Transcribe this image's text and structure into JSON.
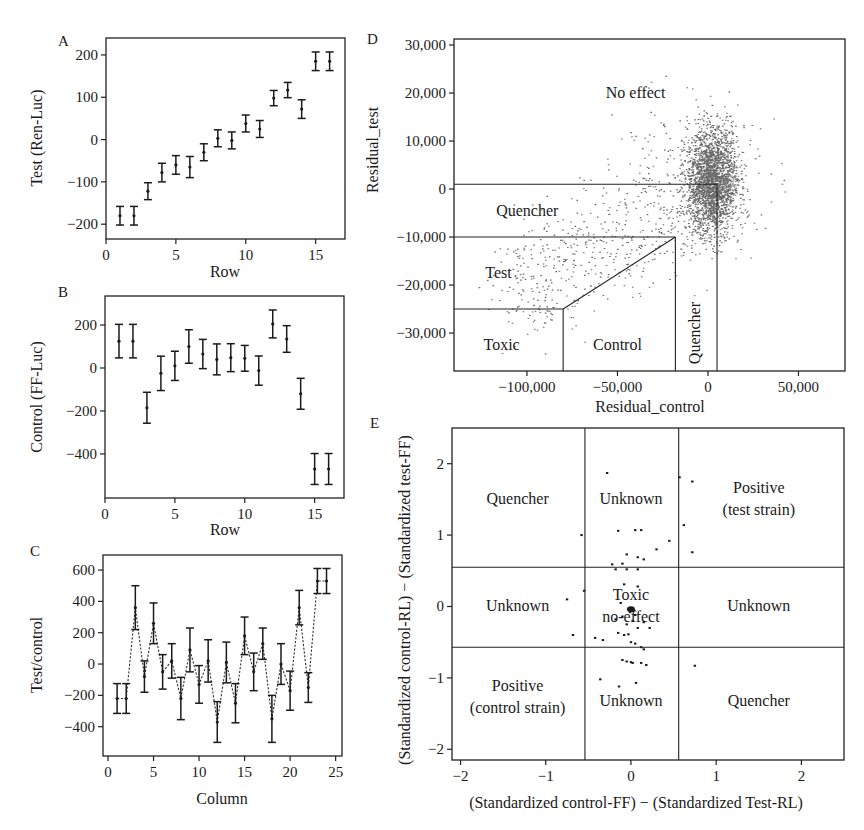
{
  "chart_data": [
    {
      "panel": "A",
      "type": "scatter",
      "style": "point with error bars",
      "xlabel": "Row",
      "ylabel": "Test (Ren-Luc)",
      "xlim": [
        0,
        17.1
      ],
      "ylim": [
        -235,
        240
      ],
      "xticks": [
        0,
        5,
        10,
        15
      ],
      "yticks": [
        -200,
        -100,
        0,
        100,
        200
      ],
      "x": [
        1,
        2,
        3,
        4,
        5,
        6,
        7,
        8,
        9,
        10,
        11,
        12,
        13,
        14,
        15,
        16
      ],
      "values": [
        -180,
        -180,
        -122,
        -78,
        -60,
        -65,
        -30,
        3,
        -2,
        38,
        25,
        98,
        117,
        72,
        185,
        185
      ],
      "err": [
        22,
        22,
        20,
        22,
        22,
        25,
        20,
        20,
        20,
        20,
        20,
        18,
        18,
        22,
        22,
        22
      ],
      "grid": false
    },
    {
      "panel": "B",
      "type": "scatter",
      "style": "point with error bars",
      "xlabel": "Row",
      "ylabel": "Control (FF-Luc)",
      "xlim": [
        0,
        17.1
      ],
      "ylim": [
        -605,
        335
      ],
      "xticks": [
        0,
        5,
        10,
        15
      ],
      "yticks": [
        -400,
        -200,
        0,
        200
      ],
      "x": [
        1,
        2,
        3,
        4,
        5,
        6,
        7,
        8,
        9,
        10,
        11,
        12,
        13,
        14,
        15,
        16
      ],
      "values": [
        125,
        125,
        -185,
        -25,
        10,
        100,
        65,
        40,
        48,
        45,
        -12,
        205,
        135,
        -120,
        -470,
        -470
      ],
      "err": [
        78,
        78,
        72,
        80,
        68,
        78,
        68,
        72,
        65,
        60,
        68,
        65,
        62,
        72,
        72,
        72
      ],
      "grid": false
    },
    {
      "panel": "C",
      "type": "line",
      "style": "dotted line with error bars",
      "xlabel": "Column",
      "ylabel": "Test/control",
      "xlim": [
        -0.55,
        25.7
      ],
      "ylim": [
        -587,
        696
      ],
      "xticks": [
        0,
        5,
        10,
        15,
        20,
        25
      ],
      "yticks": [
        -400,
        -200,
        0,
        200,
        400,
        600
      ],
      "x": [
        1,
        2,
        3,
        4,
        5,
        6,
        7,
        8,
        9,
        10,
        11,
        12,
        13,
        14,
        15,
        16,
        17,
        18,
        19,
        20,
        21,
        22,
        23,
        24
      ],
      "values": [
        -220,
        -220,
        360,
        -80,
        260,
        -50,
        20,
        -220,
        90,
        -130,
        20,
        -370,
        10,
        -250,
        180,
        -50,
        130,
        -350,
        0,
        -170,
        360,
        -150,
        530,
        530
      ],
      "err": [
        95,
        95,
        140,
        100,
        130,
        110,
        110,
        135,
        140,
        120,
        135,
        130,
        130,
        125,
        120,
        120,
        100,
        150,
        130,
        125,
        110,
        95,
        80,
        80
      ],
      "grid": false
    },
    {
      "panel": "D",
      "type": "scatter",
      "xlabel": "Residual_control",
      "ylabel": "Residual_test",
      "xlim": [
        -140300,
        75700
      ],
      "ylim": [
        -37900,
        31250
      ],
      "xticks": [
        -100000,
        -50000,
        0,
        50000
      ],
      "xtick_labels": [
        "−100,000",
        "−50,000",
        "0",
        "50,000"
      ],
      "yticks": [
        -30000,
        -20000,
        -10000,
        0,
        10000,
        20000,
        30000
      ],
      "ytick_labels": [
        "−30,000",
        "−20,000",
        "−10,000",
        "0",
        "10,000",
        "20,000",
        "30,000"
      ],
      "points_summary": {
        "n_approx": 5000,
        "core_center": [
          2000,
          1500
        ],
        "core_sd": [
          7000,
          5500
        ],
        "tail_direction": "lower-left toward (-110000, -25000)",
        "outliers_range_x": [
          -115000,
          65000
        ],
        "outliers_range_y": [
          -26000,
          26000
        ]
      },
      "regions": [
        {
          "label": "No effect",
          "x": -40000,
          "y": 20000
        },
        {
          "label": "Quencher",
          "x": -117000,
          "y": -4500
        },
        {
          "label": "Test",
          "x": -123000,
          "y": -17500
        },
        {
          "label": "Toxic",
          "x": -124000,
          "y": -32500
        },
        {
          "label": "Control",
          "x": -50000,
          "y": -32500
        },
        {
          "label": "Quencher",
          "x": -7000,
          "y": -30000,
          "rotated": true
        }
      ],
      "region_lines": [
        [
          [
            -140300,
            1000
          ],
          [
            5000,
            1000
          ]
        ],
        [
          [
            5000,
            1000
          ],
          [
            5000,
            -37900
          ]
        ],
        [
          [
            -140300,
            -10000
          ],
          [
            -18000,
            -10000
          ]
        ],
        [
          [
            -18000,
            -10000
          ],
          [
            -18000,
            -37900
          ]
        ],
        [
          [
            -18000,
            -10000
          ],
          [
            -80000,
            -25000
          ]
        ],
        [
          [
            -140300,
            -25000
          ],
          [
            -80000,
            -25000
          ]
        ],
        [
          [
            -80000,
            -25000
          ],
          [
            -80000,
            -37900
          ]
        ]
      ],
      "grid": false
    },
    {
      "panel": "E",
      "type": "scatter",
      "xlabel": "(Standardized control-FF) − (Standardized Test-RL)",
      "ylabel": "(Standardized control-RL) − (Standardized test-FF)",
      "xlim": [
        -2.1,
        2.5
      ],
      "ylim": [
        -2.15,
        2.5
      ],
      "xticks": [
        -2,
        -1,
        0,
        1,
        2
      ],
      "xtick_labels": [
        "−2",
        "−1",
        "0",
        "1",
        "2"
      ],
      "yticks": [
        -2,
        -1,
        0,
        1,
        2
      ],
      "ytick_labels": [
        "−2",
        "−1",
        "0",
        "1",
        "2"
      ],
      "cut_x": [
        -0.54,
        0.56
      ],
      "cut_y": [
        0.55,
        -0.57
      ],
      "points": [
        [
          -0.28,
          1.87
        ],
        [
          0.57,
          1.81
        ],
        [
          0.72,
          1.75
        ],
        [
          0.62,
          1.14
        ],
        [
          -0.58,
          1.0
        ],
        [
          -0.15,
          1.06
        ],
        [
          0.05,
          1.07
        ],
        [
          0.12,
          1.07
        ],
        [
          0.45,
          0.92
        ],
        [
          0.3,
          0.8
        ],
        [
          -0.05,
          0.73
        ],
        [
          0.08,
          0.69
        ],
        [
          0.15,
          0.66
        ],
        [
          0.72,
          0.76
        ],
        [
          -0.22,
          0.59
        ],
        [
          -0.1,
          0.6
        ],
        [
          -0.18,
          0.52
        ],
        [
          -0.05,
          0.52
        ],
        [
          0.08,
          0.52
        ],
        [
          -0.08,
          0.31
        ],
        [
          0.08,
          0.28
        ],
        [
          -0.55,
          0.22
        ],
        [
          -0.75,
          0.1
        ],
        [
          -0.12,
          0.05
        ],
        [
          -0.02,
          -0.05
        ],
        [
          0.0,
          -0.03
        ],
        [
          0.03,
          -0.06
        ],
        [
          -0.01,
          -0.08
        ],
        [
          0.05,
          -0.12
        ],
        [
          -0.1,
          -0.14
        ],
        [
          -0.18,
          -0.18
        ],
        [
          0.02,
          -0.2
        ],
        [
          0.15,
          -0.22
        ],
        [
          -0.05,
          -0.25
        ],
        [
          0.22,
          -0.3
        ],
        [
          0.08,
          -0.3
        ],
        [
          -0.68,
          -0.4
        ],
        [
          -0.42,
          -0.44
        ],
        [
          -0.33,
          -0.47
        ],
        [
          -0.15,
          -0.37
        ],
        [
          -0.08,
          -0.4
        ],
        [
          -0.03,
          -0.39
        ],
        [
          0.0,
          -0.5
        ],
        [
          0.05,
          -0.52
        ],
        [
          0.12,
          -0.57
        ],
        [
          0.15,
          -0.6
        ],
        [
          -0.1,
          -0.75
        ],
        [
          -0.05,
          -0.77
        ],
        [
          0.0,
          -0.78
        ],
        [
          0.02,
          -0.79
        ],
        [
          0.12,
          -0.79
        ],
        [
          0.18,
          -0.82
        ],
        [
          0.75,
          -0.83
        ],
        [
          -0.36,
          -1.02
        ],
        [
          -0.14,
          -1.12
        ],
        [
          0.06,
          -1.07
        ]
      ],
      "regions": [
        {
          "label": "Quencher",
          "lines": [
            "Quencher"
          ],
          "x": -1.33,
          "y": 1.5
        },
        {
          "label": "Unknown",
          "lines": [
            "Unknown"
          ],
          "x": 0.0,
          "y": 1.5
        },
        {
          "label": "Positive (test strain)",
          "lines": [
            "Positive",
            "(test strain)"
          ],
          "x": 1.5,
          "y": 1.5
        },
        {
          "label": "Unknown",
          "lines": [
            "Unknown"
          ],
          "x": -1.33,
          "y": 0.0
        },
        {
          "label": "Toxic no-effect",
          "lines": [
            "Toxic",
            "no-effect"
          ],
          "x": 0.0,
          "y": 0.0
        },
        {
          "label": "Unknown",
          "lines": [
            "Unknown"
          ],
          "x": 1.5,
          "y": 0.0
        },
        {
          "label": "Positive (control strain)",
          "lines": [
            "Positive",
            "(control strain)"
          ],
          "x": -1.33,
          "y": -1.27
        },
        {
          "label": "Unknown",
          "lines": [
            "Unknown"
          ],
          "x": 0.0,
          "y": -1.33
        },
        {
          "label": "Quencher",
          "lines": [
            "Quencher"
          ],
          "x": 1.5,
          "y": -1.33
        }
      ],
      "grid": false
    }
  ],
  "panels": {
    "A": {
      "label": "A",
      "xlabel": "Row",
      "ylabel": "Test (Ren-Luc)"
    },
    "B": {
      "label": "B",
      "xlabel": "Row",
      "ylabel": "Control (FF-Luc)"
    },
    "C": {
      "label": "C",
      "xlabel": "Column",
      "ylabel": "Test/control"
    },
    "D": {
      "label": "D",
      "xlabel": "Residual_control",
      "ylabel": "Residual_test"
    },
    "E": {
      "label": "E",
      "xlabel": "(Standardized control-FF) − (Standardized Test-RL)",
      "ylabel": "(Standardized control-RL) − (Standardized test-FF)"
    }
  }
}
